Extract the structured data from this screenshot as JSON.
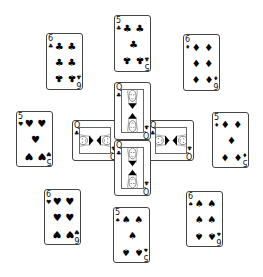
{
  "table": {
    "background": "#ffffff",
    "layout": "cross-with-surrounding-cards"
  },
  "cards": [
    {
      "id": "c1",
      "rank": "6",
      "suit": "clubs",
      "suit_glyph": "♣",
      "x": 46,
      "y": 33,
      "w": 37,
      "h": 57,
      "rot": 0
    },
    {
      "id": "c2",
      "rank": "5",
      "suit": "clubs",
      "suit_glyph": "♣",
      "x": 114,
      "y": 15,
      "w": 37,
      "h": 57,
      "rot": 0
    },
    {
      "id": "c3",
      "rank": "6",
      "suit": "diamonds",
      "suit_glyph": "♦",
      "x": 183,
      "y": 34,
      "w": 37,
      "h": 57,
      "rot": 0
    },
    {
      "id": "c4",
      "rank": "5",
      "suit": "hearts",
      "suit_glyph": "♥",
      "x": 16,
      "y": 111,
      "w": 37,
      "h": 56,
      "rot": 0
    },
    {
      "id": "c5",
      "rank": "5",
      "suit": "diamonds",
      "suit_glyph": "♦",
      "x": 212,
      "y": 112,
      "w": 37,
      "h": 56,
      "rot": 0
    },
    {
      "id": "c6",
      "rank": "6",
      "suit": "hearts",
      "suit_glyph": "♥",
      "x": 44,
      "y": 189,
      "w": 37,
      "h": 56,
      "rot": 0
    },
    {
      "id": "c7",
      "rank": "5",
      "suit": "spades",
      "suit_glyph": "♠",
      "x": 113,
      "y": 207,
      "w": 37,
      "h": 56,
      "rot": 0
    },
    {
      "id": "c8",
      "rank": "6",
      "suit": "spades",
      "suit_glyph": "♠",
      "x": 186,
      "y": 191,
      "w": 37,
      "h": 56,
      "rot": 0
    }
  ],
  "center_queens": [
    {
      "id": "q-left",
      "rank": "Q",
      "suit": "clubs",
      "suit_glyph": "♣",
      "x": 72,
      "y": 120,
      "w": 46,
      "h": 41,
      "orientation": "horizontal"
    },
    {
      "id": "q-right",
      "rank": "Q",
      "suit": "clubs",
      "suit_glyph": "♣",
      "x": 148,
      "y": 120,
      "w": 46,
      "h": 41,
      "orientation": "horizontal"
    },
    {
      "id": "q-top",
      "rank": "Q",
      "suit": "clubs",
      "suit_glyph": "♣",
      "x": 114,
      "y": 82,
      "w": 37,
      "h": 58,
      "orientation": "vertical"
    },
    {
      "id": "q-bottom",
      "rank": "Q",
      "suit": "clubs",
      "suit_glyph": "♣",
      "x": 114,
      "y": 140,
      "w": 37,
      "h": 56,
      "orientation": "vertical"
    }
  ]
}
